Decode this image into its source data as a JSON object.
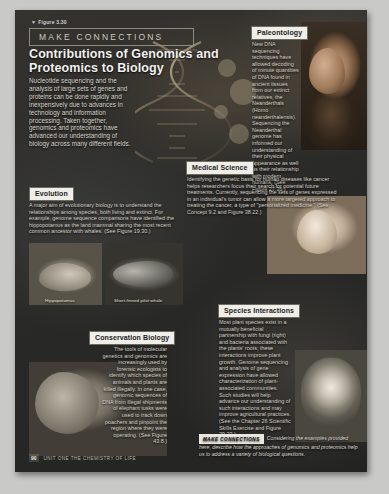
{
  "figure": {
    "number_label": "Figure 3.30",
    "banner": "MAKE CONNECTIONS",
    "title": "Contributions of Genomics and Proteomics to Biology",
    "intro": "Nucleotide sequencing and the analysis of large sets of genes and proteins can be done rapidly and inexpensively due to advances in technology and information processing. Taken together, genomics and proteomics have advanced our understanding of biology across many different fields."
  },
  "panels": [
    {
      "id": "paleontology",
      "label": "Paleontology",
      "text": "New DNA sequencing techniques have allowed decoding of minute quantities of DNA found in ancient tissues from our extinct relatives, the Neanderthals (Homo neanderthalensis). Sequencing the Neanderthal genome has informed our understanding of their physical appearance as well as their relationship with modern humans. (See Figure 27.36.)"
    },
    {
      "id": "evolution",
      "label": "Evolution",
      "text": "A major aim of evolutionary biology is to understand the relationships among species, both living and extinct. For example, genome sequence comparisons have identified the hippopotamus as the land mammal sharing the most recent common ancestor with whales. (See Figure 19.30.)"
    },
    {
      "id": "medical-science",
      "label": "Medical Science",
      "text": "Identifying the genetic basis for human diseases like cancer helps researchers focus their search for potential future treatments. Currently, sequencing the sets of genes expressed in an individual's tumor can allow a more targeted approach to treating the cancer, a type of \"personalized medicine.\" (See Concept 9.2 and Figure 38.22.)"
    },
    {
      "id": "species-interactions",
      "label": "Species Interactions",
      "text": "Most plant species exist in a mutually beneficial partnership with fungi (right) and bacteria associated with the plants' roots; these interactions improve plant growth. Genome sequencing and analysis of gene expression have allowed characterization of plant-associated communities. Such studies will help advance our understanding of such interactions and may improve agricultural practices. (See the Chapter 26 Scientific Skills Exercise and Figure 29.23.)"
    },
    {
      "id": "conservation-biology",
      "label": "Conservation Biology",
      "text": "The tools of molecular genetics and genomics are increasingly used by forensic ecologists to identify which species of animals and plants are killed illegally. In one case, genomic sequences of DNA from illegal shipments of elephant tusks were used to track down poachers and pinpoint the region where they were operating. (See Figure 43.8.)"
    }
  ],
  "photo_captions": {
    "hippopotamus": "Hippopotamus",
    "pilot_whale": "Short-finned pilot whale"
  },
  "make_connections_question": {
    "tag": "MAKE CONNECTIONS",
    "text": "Considering the examples provided here, describe how the approaches of genomics and proteomics help us to address a variety of biological questions."
  },
  "footer": {
    "page_number": "90",
    "running_head": "UNIT ONE   THE CHEMISTRY OF LIFE"
  },
  "colors": {
    "page_background": "#2b2b2b",
    "chip_background": "#efeee9",
    "body_text": "#d6d2c8",
    "title_text": "#f2f2f0"
  }
}
